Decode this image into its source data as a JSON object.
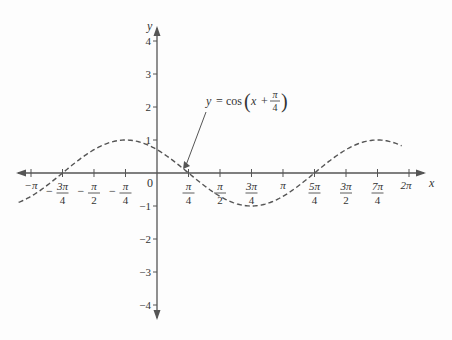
{
  "chart_data": {
    "type": "line",
    "title": "",
    "xlabel": "x",
    "ylabel": "y",
    "xlim": [
      -3.5,
      6.3
    ],
    "ylim": [
      -4.5,
      4.5
    ],
    "grid": false,
    "legend": "none",
    "x_ticks": [
      {
        "value": -3.14159,
        "label": "−π"
      },
      {
        "value": -2.35619,
        "label": "−3π/4"
      },
      {
        "value": -1.5708,
        "label": "−π/2"
      },
      {
        "value": -0.7854,
        "label": "−π/4"
      },
      {
        "value": 0,
        "label": "0"
      },
      {
        "value": 0.7854,
        "label": "π/4"
      },
      {
        "value": 1.5708,
        "label": "π/2"
      },
      {
        "value": 2.35619,
        "label": "3π/4"
      },
      {
        "value": 3.14159,
        "label": "π"
      },
      {
        "value": 3.92699,
        "label": "5π/4"
      },
      {
        "value": 4.71239,
        "label": "3π/2"
      },
      {
        "value": 5.49779,
        "label": "7π/4"
      },
      {
        "value": 6.28319,
        "label": "2π"
      }
    ],
    "y_ticks": [
      -4,
      -3,
      -2,
      -1,
      1,
      2,
      3,
      4
    ],
    "series": [
      {
        "name": "y = cos(x + π/4)",
        "style": "dashed",
        "color": "#555555",
        "function": "cos(x + pi/4)",
        "x_range": [
          -3.45,
          6.1
        ],
        "key_points": [
          {
            "x": -2.35619,
            "y": 0
          },
          {
            "x": -0.7854,
            "y": 1
          },
          {
            "x": 0,
            "y": 0.707
          },
          {
            "x": 0.7854,
            "y": 0
          },
          {
            "x": 2.35619,
            "y": -1
          },
          {
            "x": 3.92699,
            "y": 0
          },
          {
            "x": 5.49779,
            "y": 1
          }
        ]
      }
    ],
    "annotations": [
      {
        "text": "y = cos(x + π/4)",
        "arrow_to": {
          "x": 0.65,
          "y": 0.12
        }
      }
    ]
  },
  "axes": {
    "x_name": "x",
    "y_name": "y",
    "origin_label": "0"
  },
  "annotation": {
    "lhs": "y",
    "eq": "=",
    "func": "cos",
    "arg_x": "x",
    "plus": "+",
    "pi": "π",
    "denom": "4"
  },
  "colors": {
    "axis": "#555555",
    "curve": "#555555",
    "text": "#333333"
  }
}
